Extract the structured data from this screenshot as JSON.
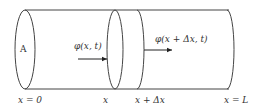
{
  "diagram": {
    "type": "cylinder-flux-slice",
    "colors": {
      "line": "#444444",
      "text": "#333333",
      "background": "#ffffff"
    },
    "area_label": "A",
    "flux_in_label": "φ(x, t)",
    "flux_out_label": "φ(x + Δx, t)",
    "axis_labels": {
      "start": "x = 0",
      "slice_left": "x",
      "slice_right": "x + Δx",
      "end": "x = L"
    }
  }
}
